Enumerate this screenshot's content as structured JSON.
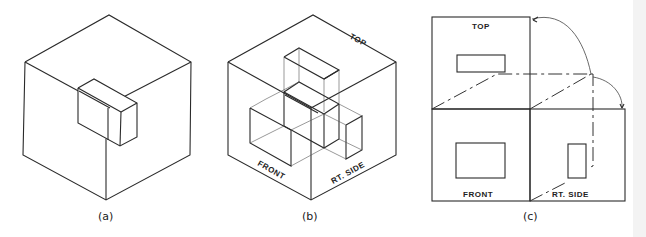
{
  "figure": {
    "panels": [
      {
        "id": "a",
        "caption": "(a)"
      },
      {
        "id": "b",
        "caption": "(b)",
        "labels": {
          "top": "TOP",
          "front": "FRONT",
          "right_side": "RT. SIDE"
        }
      },
      {
        "id": "c",
        "caption": "(c)",
        "labels": {
          "top": "TOP",
          "front": "FRONT",
          "right_side": "RT. SIDE"
        }
      }
    ],
    "colors": {
      "line": "#2a2a2a",
      "background": "#ffffff"
    }
  }
}
